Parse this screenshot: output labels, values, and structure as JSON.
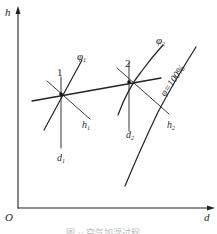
{
  "diagram": {
    "type": "psychrometric h-d chart (humidification process)",
    "axes": {
      "y_label": "h",
      "x_label": "d",
      "origin_label": "O"
    },
    "points": [
      {
        "label": "1",
        "enthalpy_label": "h",
        "enthalpy_sub": "1",
        "moisture_label": "d",
        "moisture_sub": "1",
        "rh_label": "φ",
        "rh_sub": "1"
      },
      {
        "label": "2",
        "enthalpy_label": "h",
        "enthalpy_sub": "2",
        "moisture_label": "d",
        "moisture_sub": "2",
        "rh_label": "φ",
        "rh_sub": "2"
      }
    ],
    "saturation_curve_label": "φ=100%",
    "caption": "图 ·· 空气加湿过程"
  },
  "colors": {
    "line": "#222222",
    "text": "#2a2a2a",
    "background": "#ffffff"
  }
}
